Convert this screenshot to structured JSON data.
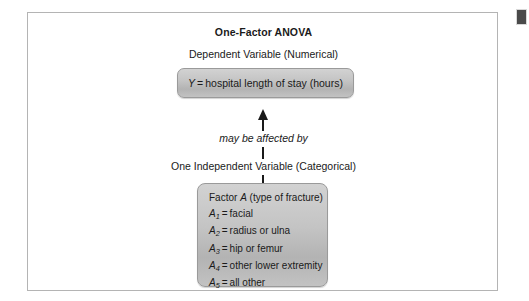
{
  "figure": {
    "title": "One-Factor ANOVA",
    "dependent_variable_label": "Dependent Variable (Numerical)",
    "relationship_label": "may be affected by",
    "independent_variable_label": "One Independent Variable (Categorical)"
  },
  "dependent_variable_box": {
    "symbol": "Y",
    "equals": "=",
    "description": "hospital length of stay (hours)",
    "full_text": "Y = hospital length of stay (hours)"
  },
  "factor_box": {
    "heading_prefix": "Factor",
    "heading_symbol": "A",
    "heading_suffix": "(type of fracture)",
    "heading_full": "Factor A (type of fracture)",
    "levels": [
      {
        "symbol": "A",
        "subscript": "1",
        "equals": "=",
        "label": "facial"
      },
      {
        "symbol": "A",
        "subscript": "2",
        "equals": "=",
        "label": "radius or ulna"
      },
      {
        "symbol": "A",
        "subscript": "3",
        "equals": "=",
        "label": "hip or femur"
      },
      {
        "symbol": "A",
        "subscript": "4",
        "equals": "=",
        "label": "other lower extremity"
      },
      {
        "symbol": "A",
        "subscript": "5",
        "equals": "=",
        "label": "all other"
      }
    ]
  },
  "colors": {
    "box_fill_top": "#d2d2d2",
    "box_fill_bottom": "#b3b3b3",
    "box_border": "#9a9a9a",
    "frame_border": "#b4b4b4",
    "text": "#1a1a1a",
    "corner_marker": "#4a4a4a",
    "page_background": "#ffffff"
  }
}
